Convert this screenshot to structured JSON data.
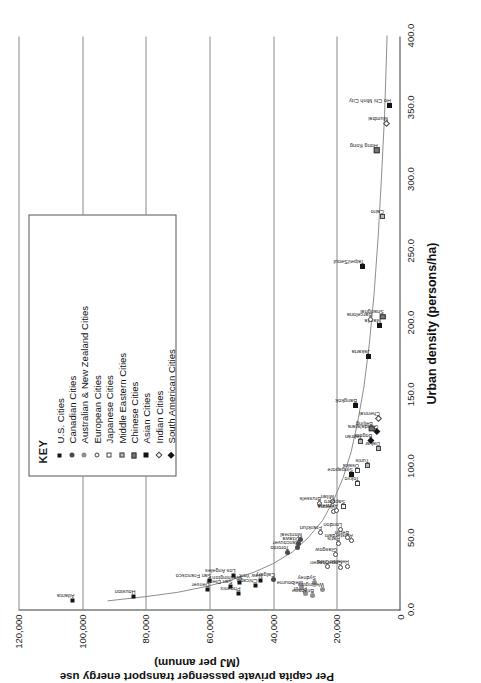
{
  "chart_data": {
    "type": "scatter",
    "title": "",
    "xlabel": "Urban density (persons/ha)",
    "ylabel_line1": "Per capita private passenger transport energy use",
    "ylabel_line2": "(MJ per annum)",
    "xlim": [
      0,
      400
    ],
    "ylim": [
      0,
      120000
    ],
    "xticks": [
      "0.0",
      "50.0",
      "100.0",
      "150.0",
      "200.0",
      "250.0",
      "300.0",
      "350.0",
      "400.0"
    ],
    "xtickvals": [
      0,
      50,
      100,
      150,
      200,
      250,
      300,
      350,
      400
    ],
    "yticks": [
      "0",
      "20,000",
      "40,000",
      "60,000",
      "80,000",
      "100,000",
      "120,000"
    ],
    "ytickvals": [
      0,
      20000,
      40000,
      60000,
      80000,
      100000,
      120000
    ],
    "grid": "horizontal-only",
    "legend_position": "top-right",
    "legend_title": "KEY",
    "series": [
      {
        "name": "U.S. Cities",
        "marker": "m-sq-f"
      },
      {
        "name": "Canadian Cities",
        "marker": "m-ci-f"
      },
      {
        "name": "Australian & New Zealand Cities",
        "marker": "m-ci-h"
      },
      {
        "name": "European Cities",
        "marker": "m-ci-o"
      },
      {
        "name": "Japanese Cities",
        "marker": "m-sq-o"
      },
      {
        "name": "Middle Eastern Cities",
        "marker": "m-sq-g"
      },
      {
        "name": "Chinese Cities",
        "marker": "m-sq-m"
      },
      {
        "name": "Asian Cities",
        "marker": "m-sq-k"
      },
      {
        "name": "Indian Cities",
        "marker": "m-di-o"
      },
      {
        "name": "South American Cities",
        "marker": "m-di-f"
      }
    ],
    "points": [
      {
        "label": "Atlanta",
        "x": 6,
        "y": 103000,
        "series": 0
      },
      {
        "label": "Houston",
        "x": 9,
        "y": 84000,
        "series": 0
      },
      {
        "label": "Denver",
        "x": 14,
        "y": 60500,
        "series": 0
      },
      {
        "label": "San Francisco",
        "x": 20,
        "y": 60000,
        "series": 0
      },
      {
        "label": "Phoenix",
        "x": 11,
        "y": 51000,
        "series": 0
      },
      {
        "label": "San Diego",
        "x": 16,
        "y": 53500,
        "series": 0
      },
      {
        "label": "Los Angeles",
        "x": 24,
        "y": 52500,
        "series": 0
      },
      {
        "label": "Washington",
        "x": 19,
        "y": 50500,
        "series": 0
      },
      {
        "label": "Chicago",
        "x": 17,
        "y": 45500,
        "series": 0
      },
      {
        "label": "New York",
        "x": 20,
        "y": 44000,
        "series": 0
      },
      {
        "label": "Calgary",
        "x": 21,
        "y": 40000,
        "series": 1
      },
      {
        "label": "Toronto",
        "x": 40,
        "y": 35500,
        "series": 1
      },
      {
        "label": "Vancouver",
        "x": 43,
        "y": 32500,
        "series": 1
      },
      {
        "label": "Ottawa",
        "x": 46,
        "y": 32000,
        "series": 1
      },
      {
        "label": "Montreal",
        "x": 49,
        "y": 31500,
        "series": 1
      },
      {
        "label": "Perth",
        "x": 11,
        "y": 30000,
        "series": 2
      },
      {
        "label": "Melbourne",
        "x": 15,
        "y": 31000,
        "series": 2
      },
      {
        "label": "Brisbane",
        "x": 10,
        "y": 27500,
        "series": 2
      },
      {
        "label": "Sydney",
        "x": 19,
        "y": 27000,
        "series": 2
      },
      {
        "label": "Wellington",
        "x": 14,
        "y": 24500,
        "series": 2
      },
      {
        "label": "Oslo",
        "x": 30,
        "y": 23000,
        "series": 3
      },
      {
        "label": "Glasgow",
        "x": 38,
        "y": 20500,
        "series": 3
      },
      {
        "label": "Copenhagen",
        "x": 29,
        "y": 19000,
        "series": 3
      },
      {
        "label": "Helsinki",
        "x": 30,
        "y": 16500,
        "series": 3
      },
      {
        "label": "Amsterdam",
        "x": 48,
        "y": 15500,
        "series": 3
      },
      {
        "label": "Frankfurt",
        "x": 54,
        "y": 25000,
        "series": 3
      },
      {
        "label": "Brussels",
        "x": 74,
        "y": 25500,
        "series": 3
      },
      {
        "label": "Vienna",
        "x": 68,
        "y": 21000,
        "series": 3
      },
      {
        "label": "Milan",
        "x": 75,
        "y": 21500,
        "series": 3
      },
      {
        "label": "Paris",
        "x": 46,
        "y": 19500,
        "series": 3
      },
      {
        "label": "London",
        "x": 56,
        "y": 19000,
        "series": 3
      },
      {
        "label": "Berlin",
        "x": 50,
        "y": 16500,
        "series": 3
      },
      {
        "label": "Antwerp",
        "x": 69,
        "y": 20000,
        "series": 3
      },
      {
        "label": "Sapporo",
        "x": 72,
        "y": 18000,
        "series": 4
      },
      {
        "label": "Tokyo",
        "x": 88,
        "y": 13500,
        "series": 4
      },
      {
        "label": "Osaka",
        "x": 97,
        "y": 13500,
        "series": 4
      },
      {
        "label": "Singapore",
        "x": 94,
        "y": 15500,
        "series": 7
      },
      {
        "label": "Tunis",
        "x": 100,
        "y": 10500,
        "series": 5
      },
      {
        "label": "Tehran",
        "x": 117,
        "y": 12500,
        "series": 5
      },
      {
        "label": "Dakar",
        "x": 112,
        "y": 7000,
        "series": 5
      },
      {
        "label": "Cairo",
        "x": 274,
        "y": 5500,
        "series": 5
      },
      {
        "label": "Bogota",
        "x": 118,
        "y": 9500,
        "series": 9
      },
      {
        "label": "Guadalajara",
        "x": 124,
        "y": 7500,
        "series": 9
      },
      {
        "label": "Beijing",
        "x": 126,
        "y": 9000,
        "series": 6
      },
      {
        "label": "Shanghai",
        "x": 204,
        "y": 5500,
        "series": 6
      },
      {
        "label": "Hong Kong",
        "x": 320,
        "y": 7500,
        "series": 6
      },
      {
        "label": "Chennai",
        "x": 133,
        "y": 7000,
        "series": 8
      },
      {
        "label": "Mumbai",
        "x": 339,
        "y": 4500,
        "series": 8
      },
      {
        "label": "Bangkok",
        "x": 142,
        "y": 14000,
        "series": 7
      },
      {
        "label": "Jakarta",
        "x": 176,
        "y": 10000,
        "series": 7
      },
      {
        "label": "Manila",
        "x": 198,
        "y": 6500,
        "series": 7
      },
      {
        "label": "Barcelona",
        "x": 202,
        "y": 9500,
        "series": 3
      },
      {
        "label": "Taipei/Seoul",
        "x": 239,
        "y": 12000,
        "series": 7
      },
      {
        "label": "Ho Chi Minh City",
        "x": 351,
        "y": 3500,
        "series": 7
      }
    ],
    "trend_curve": {
      "description": "hyperbolic decay fit through city points",
      "points": [
        [
          6,
          92000
        ],
        [
          9,
          80000
        ],
        [
          12,
          70000
        ],
        [
          16,
          61000
        ],
        [
          20,
          54000
        ],
        [
          26,
          46000
        ],
        [
          32,
          40000
        ],
        [
          40,
          34000
        ],
        [
          50,
          29000
        ],
        [
          62,
          24500
        ],
        [
          76,
          21000
        ],
        [
          92,
          18000
        ],
        [
          110,
          15500
        ],
        [
          130,
          13500
        ],
        [
          155,
          11500
        ],
        [
          185,
          9800
        ],
        [
          220,
          8300
        ],
        [
          260,
          7000
        ],
        [
          300,
          6000
        ],
        [
          345,
          5000
        ],
        [
          400,
          4200
        ]
      ]
    }
  }
}
